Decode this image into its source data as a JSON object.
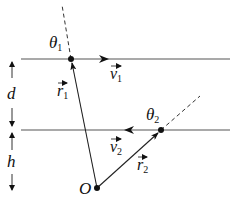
{
  "diagram": {
    "labels": {
      "theta1": "θ",
      "theta1_sub": "1",
      "theta2": "θ",
      "theta2_sub": "2",
      "v1": "v",
      "v1_sub": "1",
      "v2": "v",
      "v2_sub": "2",
      "r1": "r",
      "r1_sub": "1",
      "r2": "r",
      "r2_sub": "2",
      "d": "d",
      "h": "h",
      "origin": "O"
    },
    "colors": {
      "line": "#222222",
      "horizontal_line": "#555555",
      "background": "#ffffff"
    }
  }
}
